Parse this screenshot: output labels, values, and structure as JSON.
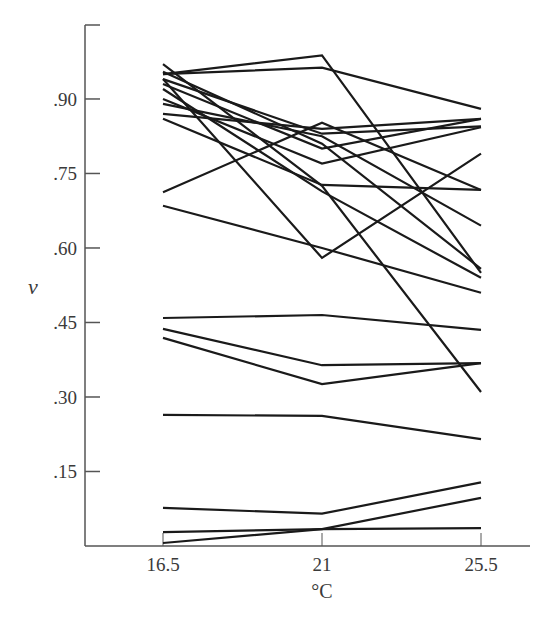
{
  "chart_data": {
    "type": "line",
    "title": "",
    "xlabel": "°C",
    "ylabel": "v",
    "x": [
      16.5,
      21,
      25.5
    ],
    "x_tick_labels": [
      "16.5",
      "21",
      "25.5"
    ],
    "y_ticks": [
      0.15,
      0.3,
      0.45,
      0.6,
      0.75,
      0.9
    ],
    "y_tick_labels": [
      ".15",
      ".30",
      ".45",
      ".60",
      ".75",
      ".90"
    ],
    "ylim": [
      0,
      1.05
    ],
    "xlim": [
      14.3,
      27.7
    ],
    "grid": false,
    "legend": null,
    "line_color": "#1a1a1a",
    "series": [
      {
        "name": "s1",
        "values": [
          0.95,
          0.988,
          0.55
        ]
      },
      {
        "name": "s2",
        "values": [
          0.95,
          0.963,
          0.88
        ]
      },
      {
        "name": "s3",
        "values": [
          0.97,
          0.725,
          0.31
        ]
      },
      {
        "name": "s4",
        "values": [
          0.94,
          0.58,
          0.79
        ]
      },
      {
        "name": "s5",
        "values": [
          0.712,
          0.852,
          0.717
        ]
      },
      {
        "name": "s6",
        "values": [
          0.685,
          0.6,
          0.51
        ]
      },
      {
        "name": "s7",
        "values": [
          0.94,
          0.83,
          0.845
        ]
      },
      {
        "name": "s8",
        "values": [
          0.93,
          0.8,
          0.86
        ]
      },
      {
        "name": "s9",
        "values": [
          0.89,
          0.825,
          0.645
        ]
      },
      {
        "name": "s10",
        "values": [
          0.9,
          0.77,
          0.843
        ]
      },
      {
        "name": "s11",
        "values": [
          0.87,
          0.84,
          0.86
        ]
      },
      {
        "name": "s12",
        "values": [
          0.86,
          0.727,
          0.717
        ]
      },
      {
        "name": "s13",
        "values": [
          0.92,
          0.714,
          0.54
        ]
      },
      {
        "name": "s14",
        "values": [
          0.955,
          0.81,
          0.558
        ]
      },
      {
        "name": "s15",
        "values": [
          0.459,
          0.465,
          0.435
        ]
      },
      {
        "name": "s16",
        "values": [
          0.437,
          0.364,
          0.368
        ]
      },
      {
        "name": "s17",
        "values": [
          0.419,
          0.326,
          0.368
        ]
      },
      {
        "name": "s18",
        "values": [
          0.264,
          0.262,
          0.215
        ]
      },
      {
        "name": "s19",
        "values": [
          0.077,
          0.065,
          0.128
        ]
      },
      {
        "name": "s20",
        "values": [
          0.028,
          0.034,
          0.036
        ]
      },
      {
        "name": "s21",
        "values": [
          0.006,
          0.034,
          0.097
        ]
      }
    ]
  },
  "axes": {
    "y_label": "v",
    "x_label": "°C"
  }
}
